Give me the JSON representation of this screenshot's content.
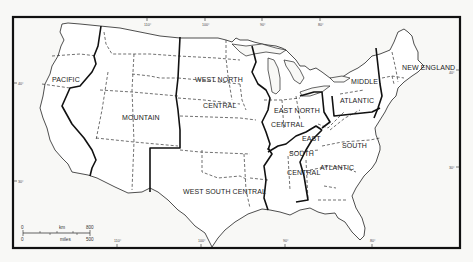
{
  "map": {
    "title": "",
    "regions": [
      {
        "id": "pacific",
        "label": "PACIFIC"
      },
      {
        "id": "mountain",
        "label": "MOUNTAIN"
      },
      {
        "id": "west-north-central",
        "label_1": "WEST NORTH",
        "label_2": "CENTRAL"
      },
      {
        "id": "west-south-central",
        "label": "WEST SOUTH CENTRAL"
      },
      {
        "id": "east-north-central",
        "label_1": "EAST NORTH",
        "label_2": "CENTRAL"
      },
      {
        "id": "east-south-central",
        "label_1": "EAST",
        "label_2": "SOUTH",
        "label_3": "CENTRAL"
      },
      {
        "id": "south-atlantic",
        "label_1": "SOUTH",
        "label_2": "ATLANTIC"
      },
      {
        "id": "middle-atlantic",
        "label_1": "MIDDLE",
        "label_2": "ATLANTIC"
      },
      {
        "id": "new-england",
        "label": "NEW ENGLAND"
      }
    ],
    "ticks": {
      "top": [
        "110°",
        "100°",
        "90°",
        "80°"
      ],
      "bottom": [
        "110°",
        "100°",
        "90°",
        "80°"
      ],
      "left": [
        "40°",
        "30°"
      ],
      "right": [
        "40°",
        "30°"
      ]
    },
    "scale_bar": {
      "km_start": "0",
      "km_label": "km",
      "km_end": "800",
      "mi_start": "0",
      "mi_label": "miles",
      "mi_end": "500"
    }
  }
}
